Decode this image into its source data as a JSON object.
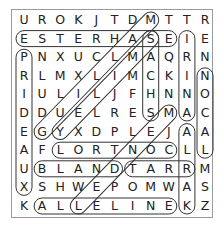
{
  "puzzle": {
    "type": "word-search",
    "rows": 11,
    "cols": 11,
    "grid": [
      [
        "U",
        "R",
        "O",
        "K",
        "J",
        "T",
        "D",
        "M",
        "T",
        "T",
        "R"
      ],
      [
        "E",
        "S",
        "T",
        "E",
        "R",
        "H",
        "A",
        "S",
        "E",
        "I",
        "E"
      ],
      [
        "P",
        "N",
        "X",
        "U",
        "C",
        "L",
        "M",
        "A",
        "Q",
        "R",
        "N"
      ],
      [
        "R",
        "L",
        "M",
        "X",
        "L",
        "I",
        "M",
        "C",
        "K",
        "I",
        "N"
      ],
      [
        "I",
        "U",
        "L",
        "I",
        "L",
        "J",
        "F",
        "H",
        "N",
        "N",
        "O"
      ],
      [
        "D",
        "D",
        "U",
        "E",
        "L",
        "R",
        "E",
        "S",
        "M",
        "A",
        "C"
      ],
      [
        "E",
        "G",
        "Y",
        "X",
        "D",
        "P",
        "L",
        "E",
        "J",
        "A",
        "A"
      ],
      [
        "A",
        "F",
        "L",
        "O",
        "R",
        "T",
        "N",
        "O",
        "C",
        "L",
        "L"
      ],
      [
        "U",
        "B",
        "L",
        "A",
        "N",
        "D",
        "T",
        "A",
        "R",
        "R",
        "M"
      ],
      [
        "X",
        "S",
        "H",
        "W",
        "E",
        "P",
        "O",
        "M",
        "W",
        "A",
        "S"
      ],
      [
        "K",
        "A",
        "L",
        "L",
        "E",
        "L",
        "I",
        "N",
        "E",
        "K",
        "Z"
      ]
    ],
    "found_words": [
      {
        "word": "ESTERHASE",
        "start": [
          1,
          0
        ],
        "end": [
          1,
          8
        ]
      },
      {
        "word": "CONTROL",
        "start": [
          7,
          8
        ],
        "end": [
          7,
          2
        ]
      },
      {
        "word": "BLAND",
        "start": [
          8,
          1
        ],
        "end": [
          8,
          5
        ]
      },
      {
        "word": "TARR",
        "start": [
          8,
          6
        ],
        "end": [
          8,
          9
        ]
      },
      {
        "word": "ALLELINE",
        "start": [
          10,
          1
        ],
        "end": [
          10,
          8
        ]
      },
      {
        "word": "PRIDEAUX",
        "start": [
          2,
          0
        ],
        "end": [
          9,
          0
        ]
      },
      {
        "word": "IRINA",
        "start": [
          1,
          9
        ],
        "end": [
          5,
          9
        ]
      },
      {
        "word": "KARLA",
        "start": [
          10,
          9
        ],
        "end": [
          6,
          9
        ]
      },
      {
        "word": "LACON",
        "start": [
          7,
          10
        ],
        "end": [
          3,
          10
        ]
      },
      {
        "word": "SACHS",
        "start": [
          1,
          7
        ],
        "end": [
          5,
          7
        ]
      },
      {
        "word": "GUILLAM",
        "start": [
          6,
          1
        ],
        "end": [
          0,
          7
        ]
      },
      {
        "word": "SMILEY",
        "start": [
          1,
          7
        ],
        "end": [
          6,
          2
        ]
      },
      {
        "word": "MENDEL",
        "start": [
          5,
          8
        ],
        "end": [
          10,
          3
        ]
      }
    ]
  },
  "layout": {
    "origin_x": 24,
    "origin_y": 20,
    "step_x": 18.1,
    "step_y": 18.6,
    "loop_color": "#333333"
  }
}
